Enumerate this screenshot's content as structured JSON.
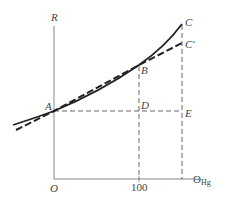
{
  "diagram": {
    "y_axis_label": "R",
    "x_axis_label": "Θ",
    "x_axis_label_subscript": "Hg",
    "origin_label": "O",
    "x_tick_label": "100",
    "points": {
      "A": "A",
      "B": "B",
      "C": "C",
      "C_prime": "C′",
      "D": "D",
      "E": "E"
    },
    "curves": [
      {
        "name": "true-resistance-curve",
        "style": "solid",
        "passes_through": [
          "A",
          "B",
          "C"
        ]
      },
      {
        "name": "linear-approximation",
        "style": "dashed",
        "passes_through": [
          "A",
          "B",
          "C′"
        ]
      }
    ],
    "guides": [
      {
        "name": "horizontal-guide-A-E",
        "style": "dashed",
        "from": "A",
        "to": "E"
      },
      {
        "name": "vertical-guide-B-100",
        "style": "dashed",
        "from": "B",
        "to": "100"
      },
      {
        "name": "vertical-guide-C-E",
        "style": "dashed",
        "from": "C",
        "to": "x-axis"
      }
    ],
    "colors": {
      "ink": "#222222",
      "axis": "#777777",
      "label": "#444444"
    }
  }
}
